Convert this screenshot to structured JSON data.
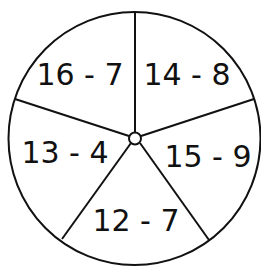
{
  "spinner": {
    "stroke_color": "#111111",
    "background": "#ffffff",
    "sections": [
      {
        "label": "16 - 7",
        "x": 80,
        "y": 75
      },
      {
        "label": "14 - 8",
        "x": 187,
        "y": 75
      },
      {
        "label": "15 - 9",
        "x": 208,
        "y": 157
      },
      {
        "label": "12 - 7",
        "x": 136,
        "y": 221
      },
      {
        "label": "13 - 4",
        "x": 65,
        "y": 153
      }
    ]
  }
}
